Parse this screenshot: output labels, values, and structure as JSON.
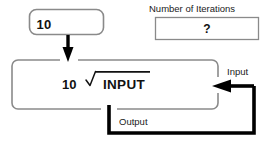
{
  "diagram": {
    "colors": {
      "stroke_thin": "#8a8a8a",
      "stroke_thick": "#000000",
      "text": "#111111",
      "background": "#ffffff"
    },
    "seed_box": {
      "name": "seed-value-box",
      "value": "10",
      "shape": "rounded-rectangle"
    },
    "iterations_box": {
      "name": "number-of-iterations-box",
      "label": "Number of Iterations",
      "value": "?",
      "shape": "rectangle"
    },
    "process_box": {
      "name": "process-box",
      "shape": "rounded-rectangle",
      "formula": {
        "coefficient": "10",
        "radical_glyph": "√",
        "radicand": "INPUT",
        "reading": "10th root of INPUT"
      }
    },
    "connectors": [
      {
        "name": "seed-arrow",
        "label": "",
        "style": "thick-filled-arrow",
        "direction": "down",
        "from": "seed-value-box",
        "to": "process-box"
      },
      {
        "name": "input-arrow",
        "label": "Input",
        "style": "thick-filled-arrow",
        "direction": "left",
        "to": "process-box"
      },
      {
        "name": "output-loop",
        "label": "Output",
        "style": "thick-line",
        "direction": "down-right-up",
        "from": "process-box",
        "to": "input-arrow"
      }
    ]
  }
}
